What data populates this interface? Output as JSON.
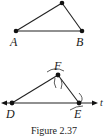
{
  "figure": {
    "caption": "Figure 2.37",
    "top_triangle": {
      "labels": {
        "A": "A",
        "B": "B"
      },
      "points": {
        "apex": [
          62,
          3
        ],
        "A": [
          16,
          31
        ],
        "B": [
          82,
          31
        ]
      }
    },
    "bottom_construction": {
      "labels": {
        "D": "D",
        "E": "E",
        "F": "F",
        "line": "t"
      },
      "points": {
        "F": [
          58,
          75
        ],
        "D": [
          12,
          103
        ],
        "E": [
          79,
          103
        ]
      },
      "line_t": {
        "y": 103,
        "x_start": 2,
        "x_end": 96
      }
    },
    "colors": {
      "ink": "#222222",
      "background": "#ffffff"
    }
  }
}
